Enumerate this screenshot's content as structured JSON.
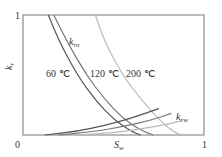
{
  "chart_data": {
    "type": "line",
    "title": "",
    "xlabel": "S_w",
    "ylabel": "k_r",
    "xlim": [
      0,
      1
    ],
    "ylim": [
      0,
      1
    ],
    "x_ticks": [
      "0",
      "1"
    ],
    "y_ticks": [
      "1"
    ],
    "grid": false,
    "legend": "inline labels",
    "curve_labels": {
      "oil": "k_ro",
      "water": "k_rw"
    },
    "series": [
      {
        "name": "k_ro 60 ℃",
        "temperature": "60 ℃",
        "color": "#555555",
        "x": [
          0.14,
          0.2,
          0.3,
          0.4,
          0.5,
          0.6,
          0.65
        ],
        "y": [
          1.0,
          0.78,
          0.5,
          0.29,
          0.13,
          0.03,
          0.0
        ]
      },
      {
        "name": "k_ro 120 ℃",
        "temperature": "120 ℃",
        "color": "#777777",
        "x": [
          0.17,
          0.25,
          0.35,
          0.45,
          0.55,
          0.65,
          0.72
        ],
        "y": [
          1.0,
          0.76,
          0.5,
          0.3,
          0.14,
          0.04,
          0.0
        ]
      },
      {
        "name": "k_ro 200 ℃",
        "temperature": "200 ℃",
        "color": "#bbbbbb",
        "x": [
          0.4,
          0.45,
          0.55,
          0.65,
          0.75,
          0.82,
          0.87
        ],
        "y": [
          1.0,
          0.78,
          0.5,
          0.3,
          0.13,
          0.04,
          0.0
        ]
      },
      {
        "name": "k_rw 60 ℃",
        "temperature": "60 ℃",
        "color": "#555555",
        "x": [
          0.12,
          0.3,
          0.45,
          0.6,
          0.75
        ],
        "y": [
          0.0,
          0.03,
          0.08,
          0.14,
          0.22
        ]
      },
      {
        "name": "k_rw 120 ℃",
        "temperature": "120 ℃",
        "color": "#777777",
        "x": [
          0.2,
          0.4,
          0.55,
          0.7,
          0.82
        ],
        "y": [
          0.0,
          0.03,
          0.07,
          0.12,
          0.18
        ]
      },
      {
        "name": "k_rw 200 ℃",
        "temperature": "200 ℃",
        "color": "#bbbbbb",
        "x": [
          0.3,
          0.5,
          0.65,
          0.8,
          0.88
        ],
        "y": [
          0.0,
          0.02,
          0.05,
          0.09,
          0.12
        ]
      }
    ]
  },
  "labels": {
    "y_top": "1",
    "origin": "0",
    "x_right": "1",
    "y_axis_main": "k",
    "y_axis_sub": "r",
    "x_axis_main": "S",
    "x_axis_sub": "w",
    "kro_main": "k",
    "kro_sub": "ro",
    "krw_main": "k",
    "krw_sub": "rw",
    "t60": "60 ℃",
    "t120": "120 ℃",
    "t200": "200 ℃"
  }
}
